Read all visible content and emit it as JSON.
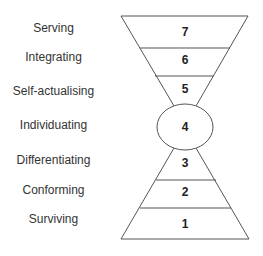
{
  "diagram": {
    "stages": [
      {
        "level": "7",
        "label": "Serving"
      },
      {
        "level": "6",
        "label": "Integrating"
      },
      {
        "level": "5",
        "label": "Self-actualising"
      },
      {
        "level": "4",
        "label": "Individuating"
      },
      {
        "level": "3",
        "label": "Differentiating"
      },
      {
        "level": "2",
        "label": "Conforming"
      },
      {
        "level": "1",
        "label": "Surviving"
      }
    ],
    "line_color": "#555555"
  }
}
